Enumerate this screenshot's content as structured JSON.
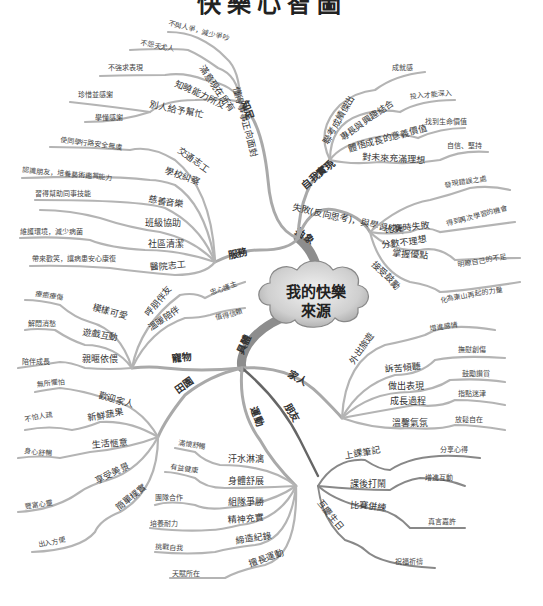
{
  "title": "快樂心智圖",
  "center": {
    "line1": "我的快樂",
    "line2": "來源"
  },
  "branches": {
    "zhi_zu": {
      "label": "知足",
      "children": [
        {
          "label": "懂得事事正向面對",
          "children": []
        },
        {
          "label": "滿意現在所有",
          "children": [
            {
              "label": "不與人爭，減少爭吵"
            }
          ]
        },
        {
          "label": "知曉能力所及",
          "children": [
            {
              "label": "不怨天尤人"
            }
          ]
        },
        {
          "label": "別人給予幫忙",
          "children": [
            {
              "label": "不強求表現"
            },
            {
              "label": "珍惜並感謝"
            },
            {
              "label": "學懂感謝"
            }
          ]
        }
      ]
    },
    "fu_wu": {
      "label": "服務",
      "children": [
        {
          "label": "交通志工",
          "children": [
            {
              "label": "使同學行路安全無虞"
            }
          ]
        },
        {
          "label": "學校糾察",
          "children": [
            {
              "label": "認識朋友，培養藝術鑑賞能力"
            }
          ]
        },
        {
          "label": "慈善音樂",
          "children": [
            {
              "label": "習得幫助同事技能"
            }
          ]
        },
        {
          "label": "班級協助",
          "children": []
        },
        {
          "label": "社區清潔",
          "children": [
            {
              "label": "維護環境，減少病菌"
            }
          ]
        },
        {
          "label": "醫院志工",
          "children": [
            {
              "label": "帶來歡笑，讓病患安心康復"
            }
          ]
        }
      ]
    },
    "zi_wo_shi_xian": {
      "label": "自我實現",
      "children": [
        {
          "label": "聯考成績傑出",
          "children": [
            {
              "label": "成就感"
            }
          ]
        },
        {
          "label": "專長與興趣結合",
          "children": [
            {
              "label": "投入才能深入"
            }
          ]
        },
        {
          "label": "體悟成長的意義價值",
          "children": [
            {
              "label": "找到生命價值"
            }
          ]
        },
        {
          "label": "對未來充滿理想",
          "children": [
            {
              "label": "自信、堅持"
            }
          ]
        }
      ]
    },
    "shi_bai": {
      "label": "失敗(反向思考)，與學習成長",
      "children": [
        {
          "label": "分數不理想",
          "children": [
            {
              "label": "發現錯誤之處"
            }
          ]
        },
        {
          "label": "比賽時失敗",
          "children": [
            {
              "label": "得到再次學習的機會"
            }
          ]
        },
        {
          "label": "掌握優點",
          "children": [
            {
              "label": "明瞭自己的不足"
            }
          ]
        },
        {
          "label": "接受鼓勵",
          "children": [
            {
              "label": "化為東山再起的力量"
            }
          ]
        }
      ]
    },
    "chou_xiang": {
      "label": "抽象"
    },
    "ju_ti": {
      "label": "具體"
    },
    "chong_wu": {
      "label": "寵物",
      "children": [
        {
          "label": "呼朋伴友",
          "children": [
            {
              "label": "忠心護主"
            }
          ]
        },
        {
          "label": "溫暖陪伴",
          "children": [
            {
              "label": "值得信賴"
            }
          ]
        },
        {
          "label": "模樣可愛",
          "children": [
            {
              "label": "療癒療傷"
            }
          ]
        },
        {
          "label": "遊戲互動",
          "children": [
            {
              "label": "解悶消愁"
            }
          ]
        },
        {
          "label": "親暱依偎",
          "children": [
            {
              "label": "陪伴成長"
            }
          ]
        }
      ]
    },
    "tian_yuan": {
      "label": "田園",
      "children": [
        {
          "label": "歡迎家人",
          "children": [
            {
              "label": "無所懼怕"
            }
          ]
        },
        {
          "label": "新鮮蔬果",
          "children": [
            {
              "label": "不怕人疏"
            }
          ]
        },
        {
          "label": "生活愜意",
          "children": [
            {
              "label": "身心舒暢"
            }
          ]
        },
        {
          "label": "享受美景",
          "children": [
            {
              "label": "豐富心靈"
            }
          ]
        },
        {
          "label": "簡單樸實",
          "children": [
            {
              "label": "出入方便"
            }
          ]
        }
      ]
    },
    "jia_ren": {
      "label": "家人",
      "children": [
        {
          "label": "外出旅遊",
          "children": [
            {
              "label": "增進感情"
            }
          ]
        },
        {
          "label": "訴苦傾聽",
          "children": [
            {
              "label": "撫慰創傷"
            }
          ]
        },
        {
          "label": "做出表現",
          "children": [
            {
              "label": "鼓勵讚賞"
            }
          ]
        },
        {
          "label": "成長過程",
          "children": [
            {
              "label": "指點迷津"
            }
          ]
        },
        {
          "label": "溫馨氣氛",
          "children": [
            {
              "label": "放鬆自在"
            }
          ]
        }
      ]
    },
    "yun_dong": {
      "label": "運動",
      "children": [
        {
          "label": "汗水淋漓",
          "children": [
            {
              "label": "滿懷舒暢"
            }
          ]
        },
        {
          "label": "身體舒展",
          "children": [
            {
              "label": "有益健康"
            }
          ]
        },
        {
          "label": "組隊爭勝",
          "children": [
            {
              "label": "團隊合作"
            }
          ]
        },
        {
          "label": "精神充實",
          "children": [
            {
              "label": "培養耐力"
            }
          ]
        },
        {
          "label": "締造紀錄",
          "children": [
            {
              "label": "挑戰自我"
            }
          ]
        },
        {
          "label": "擅長運動",
          "children": [
            {
              "label": "天賦所在"
            }
          ]
        }
      ]
    },
    "peng_you": {
      "label": "朋友",
      "children": [
        {
          "label": "上課筆記",
          "children": [
            {
              "label": "分享心得"
            }
          ]
        },
        {
          "label": "課後打鬧",
          "children": [
            {
              "label": "增進互動"
            }
          ]
        },
        {
          "label": "比賽併練",
          "children": [
            {
              "label": "真言嘉許"
            }
          ]
        },
        {
          "label": "互慶生日",
          "children": [
            {
              "label": "祝福祈禱"
            }
          ]
        }
      ]
    }
  },
  "colors": {
    "branch_light": "#a9a9a9",
    "branch_dark": "#666666",
    "cloud_fill": "#c8c8c8",
    "cloud_stroke": "#888888",
    "background": "#ffffff"
  }
}
